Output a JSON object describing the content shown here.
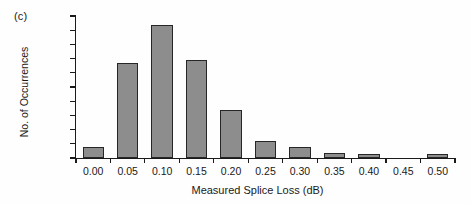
{
  "panel": {
    "label": "(c)"
  },
  "chart_data": {
    "type": "bar",
    "title": "",
    "subtitle": "",
    "xlabel": "Measured Splice Loss (dB)",
    "ylabel": "No. of Occurrences",
    "categories": [
      "0.00",
      "0.05",
      "0.10",
      "0.15",
      "0.20",
      "0.25",
      "0.30",
      "0.35",
      "0.40",
      "0.45",
      "0.50"
    ],
    "values": [
      15,
      134,
      187,
      138,
      68,
      24,
      15,
      7,
      5,
      0,
      5
    ],
    "series": [
      {
        "name": "No. of Occurrences",
        "values": [
          15,
          134,
          187,
          138,
          68,
          24,
          15,
          7,
          5,
          0,
          5
        ]
      }
    ],
    "ylim": [
      0,
      200
    ],
    "xlim_categories": [
      "0.00",
      "0.50"
    ],
    "yticks": [
      0,
      20,
      40,
      60,
      80,
      100,
      120,
      140,
      160,
      180,
      200
    ],
    "ytick_labels": [
      "0",
      "20",
      "40",
      "60",
      "80",
      "100",
      "120",
      "140",
      "160",
      "180",
      "200"
    ],
    "grid": false,
    "legend": false,
    "legend_position": "none",
    "bar_fill_color": "#8d8d8d",
    "bar_edge_color": "#262626",
    "axis_color": "#1a1a1a",
    "background_color": "#ffffff",
    "annotations": []
  }
}
